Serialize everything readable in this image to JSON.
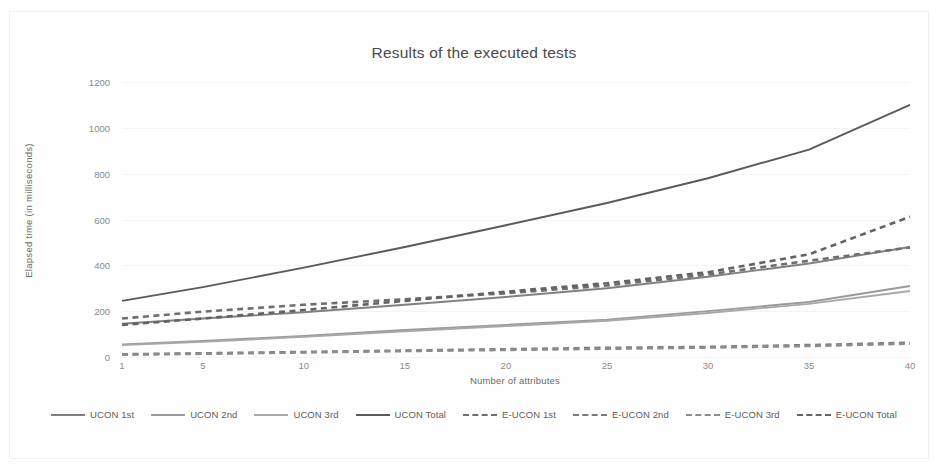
{
  "chart_data": {
    "type": "line",
    "title": "Results of the executed tests",
    "xlabel": "Number of attributes",
    "ylabel": "Elapsed time (in milliseconds)",
    "xlim": [
      1,
      40
    ],
    "ylim": [
      0,
      1200
    ],
    "yticks": [
      0,
      200,
      400,
      600,
      800,
      1000,
      1200
    ],
    "xticks": [
      1,
      5,
      10,
      15,
      20,
      25,
      30,
      35,
      40
    ],
    "grid": true,
    "legend_position": "bottom",
    "x": [
      1,
      5,
      10,
      15,
      20,
      25,
      30,
      35,
      40
    ],
    "series": [
      {
        "name": "UCON 1st",
        "style": "solid",
        "color": "#808080",
        "values": [
          145,
          168,
          195,
          228,
          262,
          300,
          350,
          408,
          480
        ]
      },
      {
        "name": "UCON 2nd",
        "style": "solid",
        "color": "#9a9a9a",
        "values": [
          55,
          70,
          92,
          118,
          140,
          163,
          200,
          240,
          310
        ]
      },
      {
        "name": "UCON 3rd",
        "style": "solid",
        "color": "#a8a8a8",
        "values": [
          52,
          66,
          88,
          112,
          135,
          158,
          192,
          232,
          288
        ]
      },
      {
        "name": "UCON Total",
        "style": "solid",
        "color": "#5a5a5a",
        "values": [
          245,
          305,
          390,
          480,
          575,
          672,
          780,
          905,
          1100
        ]
      },
      {
        "name": "E-UCON 1st",
        "style": "dashed",
        "color": "#6e6e6e",
        "values": [
          168,
          198,
          228,
          252,
          278,
          312,
          360,
          420,
          478
        ]
      },
      {
        "name": "E-UCON 2nd",
        "style": "dashed",
        "color": "#7a7a7a",
        "values": [
          12,
          16,
          22,
          28,
          34,
          40,
          44,
          52,
          62
        ]
      },
      {
        "name": "E-UCON 3rd",
        "style": "dashed",
        "color": "#8c8c8c",
        "values": [
          10,
          14,
          20,
          26,
          31,
          36,
          41,
          48,
          58
        ]
      },
      {
        "name": "E-UCON Total",
        "style": "dashed",
        "color": "#636363",
        "values": [
          140,
          168,
          205,
          245,
          285,
          322,
          370,
          448,
          612
        ]
      }
    ]
  },
  "legend": {
    "items": [
      {
        "label": "UCON 1st"
      },
      {
        "label": "UCON 2nd"
      },
      {
        "label": "UCON 3rd"
      },
      {
        "label": "UCON Total"
      },
      {
        "label": "E-UCON 1st"
      },
      {
        "label": "E-UCON 2nd"
      },
      {
        "label": "E-UCON 3rd"
      },
      {
        "label": "E-UCON Total"
      }
    ]
  }
}
